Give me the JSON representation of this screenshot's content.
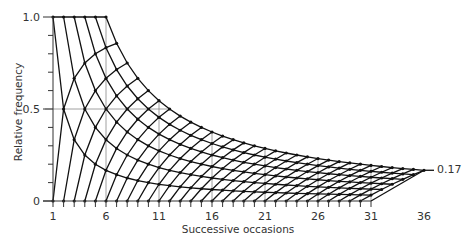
{
  "chart_data": {
    "type": "line",
    "title": "",
    "xlabel": "Successive occasions",
    "ylabel": "Relative frequency",
    "x_ticks": [
      1,
      6,
      11,
      16,
      21,
      26,
      31,
      36
    ],
    "y_ticks": [
      {
        "value": 0,
        "label": "0"
      },
      {
        "value": 0.5,
        "label": "0.5"
      },
      {
        "value": 1.0,
        "label": "1.0"
      }
    ],
    "xlim": [
      1,
      36
    ],
    "ylim": [
      0,
      1.0
    ],
    "annotation": {
      "text": "0.17",
      "x": 36,
      "y": 0.17
    },
    "grid": {
      "vertical_at": [
        6,
        11,
        16,
        21,
        26,
        31
      ],
      "horizontal_at": [
        0.5
      ]
    },
    "lattice": {
      "description": "Points (n, a/n) with a successes (0-6) and b failures; n = a + b",
      "max_successes": 6,
      "max_failures": 30,
      "bottom_last_occasion": 31,
      "upper_boundary": "6/n for n = 6..36",
      "top_row": "1.0 for n = 1..6",
      "end_point": {
        "x": 36,
        "y": 0.167
      }
    }
  },
  "labels": {
    "xlabel": "Successive occasions",
    "ylabel": "Relative frequency",
    "end_value": "0.17"
  }
}
